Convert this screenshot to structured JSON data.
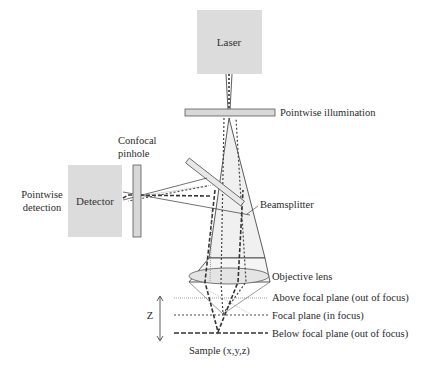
{
  "colors": {
    "box_fill": "#dcdcdc",
    "plate_fill": "#d8d8d8",
    "cone_fill": "#f0f0f0",
    "line": "#333333",
    "background": "#ffffff"
  },
  "components": {
    "laser": {
      "label": "Laser"
    },
    "illumination_plate": {
      "label": "Pointwise illumination"
    },
    "beamsplitter": {
      "label": "Beamsplitter"
    },
    "detector": {
      "label": "Detector"
    },
    "detection": {
      "label_line1": "Pointwise",
      "label_line2": "detection"
    },
    "pinhole": {
      "label_line1": "Confocal",
      "label_line2": "pinhole"
    },
    "objective": {
      "label": "Objective lens"
    }
  },
  "planes": [
    {
      "label": "Above focal plane (out of focus)",
      "style": "dotted"
    },
    {
      "label": "Focal plane (in focus)",
      "style": "dashed"
    },
    {
      "label": "Below focal plane (out of focus)",
      "style": "long-dashed"
    }
  ],
  "axis": {
    "label": "Z"
  },
  "sample": {
    "label": "Sample (x,y,z)"
  }
}
